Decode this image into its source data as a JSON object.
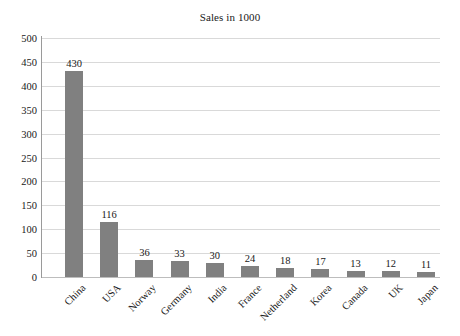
{
  "chart_data": {
    "type": "bar",
    "title": "Sales in 1000",
    "xlabel": "",
    "ylabel": "",
    "categories": [
      "China",
      "USA",
      "Norway",
      "Germany",
      "India",
      "France",
      "Netherland",
      "Korea",
      "Canada",
      "UK",
      "Japan"
    ],
    "values": [
      430,
      116,
      36,
      33,
      30,
      24,
      18,
      17,
      13,
      12,
      11
    ],
    "value_labels": [
      "430",
      "116",
      "36",
      "33",
      "30",
      "24",
      "18",
      "17",
      "13",
      "12",
      "11"
    ],
    "ylim": [
      0,
      500
    ],
    "ytick_step": 50,
    "ytick_labels": [
      "500",
      "450",
      "400",
      "350",
      "300",
      "250",
      "200",
      "150",
      "100",
      "50",
      "0"
    ],
    "ytick_values": [
      500,
      450,
      400,
      350,
      300,
      250,
      200,
      150,
      100,
      50,
      0
    ],
    "grid": true,
    "legend": false,
    "legend_position": "none",
    "bar_color": "#808080",
    "gridline_color": "#d9d9d9",
    "axis_color": "#9a9a9a",
    "text_color": "#202020",
    "background_color": "#ffffff"
  }
}
